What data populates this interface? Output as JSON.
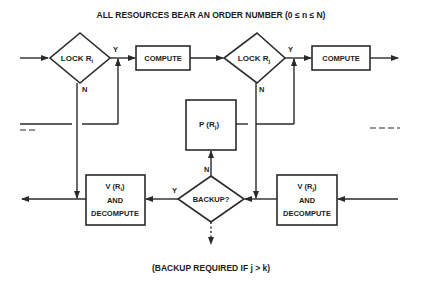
{
  "title": "ALL RESOURCES BEAR AN ORDER NUMBER (0 ≤ n ≤ N)",
  "footer": "(BACKUP REQUIRED IF j > k)",
  "nodes": {
    "lock_i": {
      "label": "LOCK R",
      "sub": "i",
      "shape": "diamond"
    },
    "compute_1": {
      "label": "COMPUTE",
      "shape": "box"
    },
    "lock_j": {
      "label": "LOCK R",
      "sub": "j",
      "shape": "diamond"
    },
    "compute_2": {
      "label": "COMPUTE",
      "shape": "box"
    },
    "p_rj": {
      "label": "P (R",
      "sub": "j",
      "close": ")",
      "shape": "box"
    },
    "backup": {
      "label": "BACKUP?",
      "shape": "diamond"
    },
    "v_ri": {
      "line1": "V (R",
      "sub": "i",
      "close": ")",
      "line2": "AND",
      "line3": "DECOMPUTE",
      "shape": "box"
    },
    "v_rj": {
      "line1": "V (R",
      "sub": "j",
      "close": ")",
      "line2": "AND",
      "line3": "DECOMPUTE",
      "shape": "box"
    }
  },
  "edge_labels": {
    "lock_i_yes": "Y",
    "lock_i_no": "N",
    "lock_j_yes": "Y",
    "lock_j_no": "N",
    "backup_yes": "Y",
    "backup_no": "N"
  },
  "continuations": {
    "left": "— —",
    "right": "— — —"
  }
}
